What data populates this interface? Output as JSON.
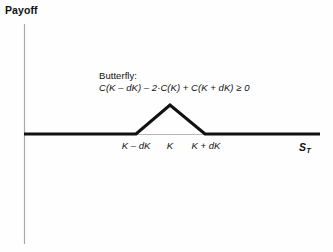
{
  "figure": {
    "background_color": "#fefefe",
    "axis_color": "#a8a8a8",
    "curve_color": "#111111",
    "text_color": "#111111"
  },
  "axes": {
    "y_axis_label": "Payoff",
    "x_axis_label_base": "S",
    "x_axis_label_sub": "T"
  },
  "annotation": {
    "title": "Butterfly:",
    "formula": "C(K – dK) – 2·C(K) + C(K + dK) ≥ 0"
  },
  "tick_labels": [
    {
      "text": "K – dK",
      "x_px": 136
    },
    {
      "text": "K",
      "x_px": 170
    },
    {
      "text": "K + dK",
      "x_px": 206
    }
  ],
  "chart_data": {
    "type": "line",
    "title": "",
    "subtitle": "",
    "xlabel": "S_T",
    "ylabel": "Payoff",
    "grid": false,
    "legend": null,
    "annotations": [
      {
        "text": "Butterfly: C(K – dK) – 2·C(K) + C(K + dK) ≥ 0",
        "x_px": 99,
        "y_px": 71
      }
    ],
    "axis_origin_px": {
      "x": 24,
      "y": 134
    },
    "x_axis_range_px": [
      24,
      320
    ],
    "y_axis_range_px": [
      24,
      244
    ],
    "series": [
      {
        "name": "Butterfly payoff at expiry",
        "description": "Zero below K – dK, rises linearly to a peak at K, falls linearly to zero at K + dK, zero thereafter",
        "points_px": [
          {
            "x": 24,
            "y": 134
          },
          {
            "x": 136,
            "y": 134
          },
          {
            "x": 170,
            "y": 105
          },
          {
            "x": 205,
            "y": 134
          },
          {
            "x": 320,
            "y": 134
          }
        ],
        "points_logical": [
          {
            "x": "0",
            "y": 0
          },
          {
            "x": "K – dK",
            "y": 0
          },
          {
            "x": "K",
            "y": "dK"
          },
          {
            "x": "K + dK",
            "y": 0
          },
          {
            "x": "max",
            "y": 0
          }
        ]
      }
    ],
    "baseline_px": {
      "y": 134,
      "x_from": 24,
      "x_to": 320
    }
  }
}
